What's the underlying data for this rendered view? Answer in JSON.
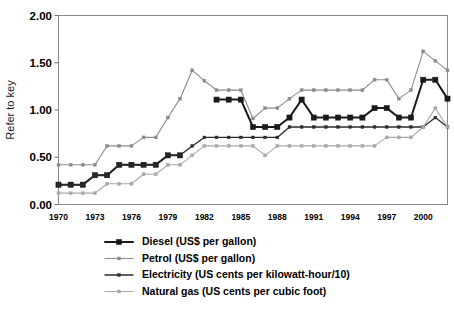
{
  "chart_data": {
    "type": "line",
    "title": "",
    "xlabel": "",
    "ylabel": "Refer to key",
    "ylim": [
      0.0,
      2.0
    ],
    "ytick_labels": [
      "0.00",
      "0.50",
      "1.00",
      "1.50",
      "2.00"
    ],
    "ytick_values": [
      0.0,
      0.5,
      1.0,
      1.5,
      2.0
    ],
    "xlim": [
      1970,
      2002
    ],
    "xtick_labels": [
      "1970",
      "1973",
      "1976",
      "1979",
      "1982",
      "1985",
      "1988",
      "1991",
      "1994",
      "1997",
      "2000"
    ],
    "xtick_values": [
      1970,
      1973,
      1976,
      1979,
      1982,
      1985,
      1988,
      1991,
      1994,
      1997,
      2000
    ],
    "grid": false,
    "legend_position": "below",
    "x": [
      1970,
      1971,
      1972,
      1973,
      1974,
      1975,
      1976,
      1977,
      1978,
      1979,
      1980,
      1981,
      1982,
      1983,
      1984,
      1985,
      1986,
      1987,
      1988,
      1989,
      1990,
      1991,
      1992,
      1993,
      1994,
      1995,
      1996,
      1997,
      1998,
      1999,
      2000,
      2001,
      2002
    ],
    "series": [
      {
        "name": "Diesel (US$ per gallon)",
        "color": "#1a1a1a",
        "marker": "square-large",
        "line_width": 2.0,
        "values": [
          0.21,
          0.21,
          0.21,
          0.31,
          0.31,
          0.42,
          0.42,
          0.42,
          0.42,
          0.52,
          0.52,
          null,
          null,
          1.11,
          1.11,
          1.11,
          0.82,
          0.82,
          0.82,
          0.92,
          1.11,
          0.92,
          0.92,
          0.92,
          0.92,
          0.92,
          1.02,
          1.02,
          0.92,
          0.92,
          1.32,
          1.32,
          1.12
        ]
      },
      {
        "name": "Petrol (US$ per gallon)",
        "color": "#8c8c8c",
        "marker": "square-small",
        "line_width": 1.1,
        "values": [
          0.42,
          0.42,
          0.42,
          0.42,
          0.62,
          0.62,
          0.62,
          0.71,
          0.71,
          0.92,
          1.12,
          1.42,
          1.31,
          1.21,
          1.21,
          1.21,
          0.91,
          1.02,
          1.02,
          1.12,
          1.21,
          1.21,
          1.21,
          1.21,
          1.21,
          1.21,
          1.32,
          1.32,
          1.12,
          1.21,
          1.62,
          1.52,
          1.42
        ]
      },
      {
        "name": "Electricity (US cents per kilowatt-hour/10)",
        "color": "#2b2b2b",
        "marker": "dot-small",
        "line_width": 1.3,
        "values": [
          0.21,
          0.21,
          0.21,
          0.31,
          0.31,
          0.42,
          0.42,
          0.42,
          0.42,
          0.52,
          0.52,
          0.62,
          0.71,
          0.71,
          0.71,
          0.71,
          0.71,
          0.71,
          0.71,
          0.82,
          0.82,
          0.82,
          0.82,
          0.82,
          0.82,
          0.82,
          0.82,
          0.82,
          0.82,
          0.82,
          0.82,
          0.92,
          0.82
        ]
      },
      {
        "name": "Natural gas (US cents per cubic foot)",
        "color": "#a8a8a8",
        "marker": "square-small",
        "line_width": 1.1,
        "values": [
          0.12,
          0.12,
          0.12,
          0.12,
          0.22,
          0.22,
          0.22,
          0.32,
          0.32,
          0.42,
          0.42,
          0.52,
          0.62,
          0.62,
          0.62,
          0.62,
          0.62,
          0.52,
          0.62,
          0.62,
          0.62,
          0.62,
          0.62,
          0.62,
          0.62,
          0.62,
          0.62,
          0.71,
          0.71,
          0.71,
          0.82,
          1.02,
          0.82
        ]
      }
    ]
  },
  "legend": {
    "items": [
      {
        "label": "Diesel (US$ per gallon)"
      },
      {
        "label": "Petrol (US$ per gallon)"
      },
      {
        "label": "Electricity (US cents per kilowatt-hour/10)"
      },
      {
        "label": "Natural gas (US cents per cubic foot)"
      }
    ]
  },
  "colors": {
    "diesel": "#1a1a1a",
    "petrol": "#8c8c8c",
    "electricity": "#2b2b2b",
    "natural_gas": "#a8a8a8",
    "frame": "#8a8a8a",
    "background": "#ffffff"
  }
}
